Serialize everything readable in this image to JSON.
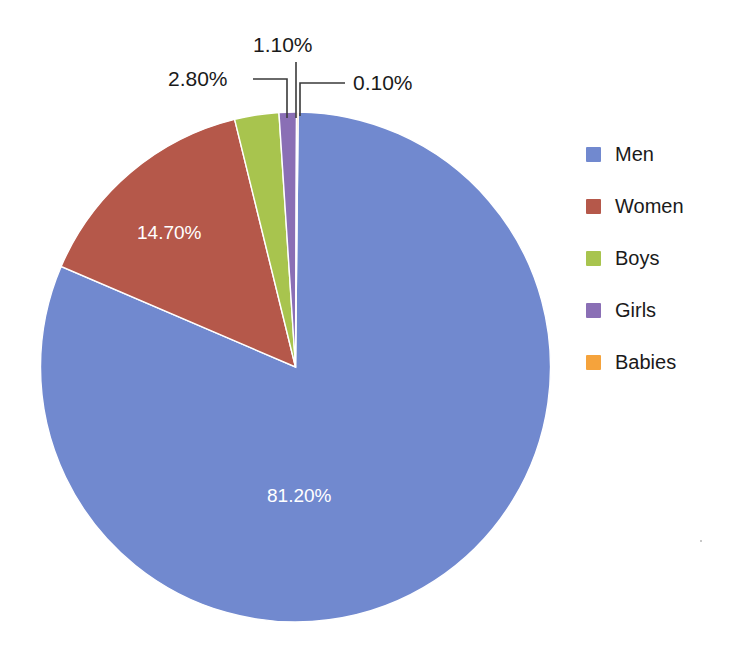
{
  "chart_data": {
    "type": "pie",
    "title": "",
    "subtitle": "",
    "xlabel": "",
    "ylabel": "",
    "grid": false,
    "legend_position": "right",
    "categories": [
      "Men",
      "Women",
      "Boys",
      "Girls",
      "Babies"
    ],
    "values": [
      81.2,
      14.7,
      2.8,
      1.1,
      0.1
    ],
    "value_labels": [
      "81.20%",
      "14.70%",
      "2.80%",
      "1.10%",
      "0.10%"
    ],
    "colors": [
      "#7189cf",
      "#b5584a",
      "#a8c44e",
      "#8a6fb5",
      "#f5a33c"
    ],
    "label_units": "percent",
    "slices": [
      {
        "name": "Men",
        "value": 81.2,
        "label": "81.20%",
        "color": "#7189cf",
        "label_placement": "inside",
        "label_color": "#ffffff"
      },
      {
        "name": "Women",
        "value": 14.7,
        "label": "14.70%",
        "color": "#b5584a",
        "label_placement": "inside",
        "label_color": "#ffffff"
      },
      {
        "name": "Boys",
        "value": 2.8,
        "label": "2.80%",
        "color": "#a8c44e",
        "label_placement": "outside",
        "label_color": "#1a1a1a"
      },
      {
        "name": "Girls",
        "value": 1.1,
        "label": "1.10%",
        "color": "#8a6fb5",
        "label_placement": "outside",
        "label_color": "#1a1a1a"
      },
      {
        "name": "Babies",
        "value": 0.1,
        "label": "0.10%",
        "color": "#f5a33c",
        "label_placement": "outside",
        "label_color": "#1a1a1a"
      }
    ]
  },
  "legend": {
    "items": [
      {
        "label": "Men",
        "color": "#7189cf"
      },
      {
        "label": "Women",
        "color": "#b5584a"
      },
      {
        "label": "Boys",
        "color": "#a8c44e"
      },
      {
        "label": "Girls",
        "color": "#8a6fb5"
      },
      {
        "label": "Babies",
        "color": "#f5a33c"
      }
    ]
  },
  "callouts": {
    "boys": "2.80%",
    "girls": "1.10%",
    "babies": "0.10%"
  },
  "inner_labels": {
    "men": "81.20%",
    "women": "14.70%"
  },
  "background_color": "#ffffff"
}
